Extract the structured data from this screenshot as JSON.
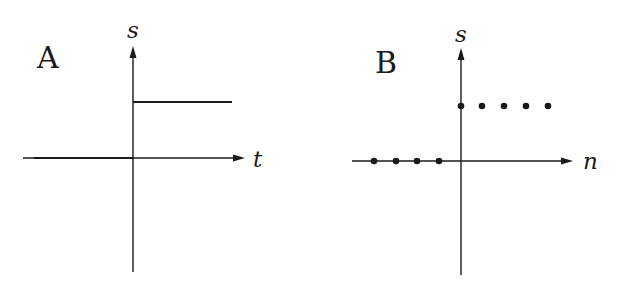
{
  "figure": {
    "background": "#ffffff",
    "ink_color": "#1a1a1a",
    "panels": [
      {
        "id": "A",
        "label": "A",
        "type": "continuous-time unit step",
        "y_axis_label": "s",
        "x_axis_label": "t",
        "description": "Signal s(t) is 0 for t<0 and a constant positive level for t>=0"
      },
      {
        "id": "B",
        "label": "B",
        "type": "discrete-time unit step",
        "y_axis_label": "s",
        "x_axis_label": "n",
        "samples_zero": [
          -4,
          -3,
          -2,
          -1
        ],
        "samples_one": [
          0,
          1,
          2,
          3,
          4
        ],
        "description": "Sequence s[n] is 0 for n<0 (dots on axis) and a constant positive level for n>=0"
      }
    ]
  }
}
